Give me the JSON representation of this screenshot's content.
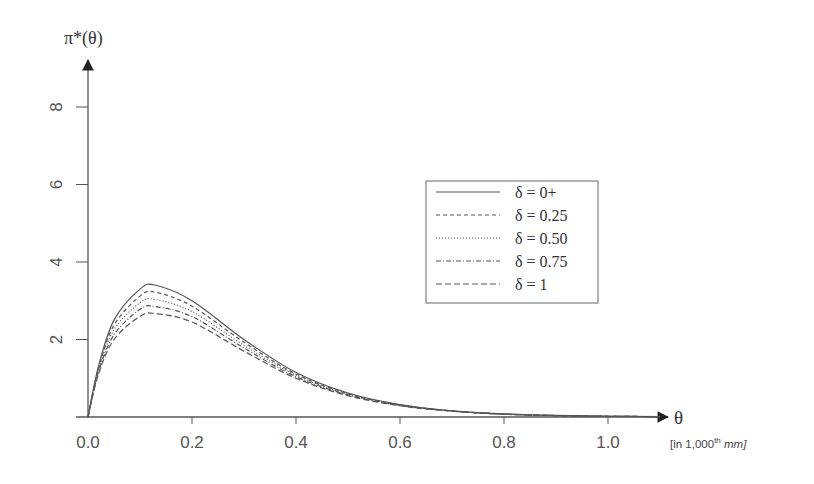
{
  "chart_data": {
    "type": "line",
    "title": "",
    "ylabel": "π*(θ)",
    "xlabel": "θ",
    "xlabel_unit_prefix": "[in 1,000",
    "xlabel_unit_sup": "th",
    "xlabel_unit_suffix": " mm]",
    "xlim": [
      0,
      1.1
    ],
    "ylim": [
      0,
      9
    ],
    "x_ticks": [
      0.0,
      0.2,
      0.4,
      0.6,
      0.8,
      1.0
    ],
    "x_tick_labels": [
      "0.0",
      "0.2",
      "0.4",
      "0.6",
      "0.8",
      "1.0"
    ],
    "y_ticks": [
      2,
      4,
      6,
      8
    ],
    "y_tick_labels": [
      "2",
      "4",
      "6",
      "8"
    ],
    "grid": false,
    "legend_position": "center-right",
    "x": [
      0,
      0.02,
      0.05,
      0.1,
      0.13,
      0.2,
      0.3,
      0.4,
      0.5,
      0.6,
      0.7,
      0.8,
      0.9,
      1.0,
      1.1
    ],
    "series": [
      {
        "name": "δ = 0+",
        "style": "solid",
        "values": [
          0,
          1.3,
          2.5,
          3.3,
          3.4,
          3.0,
          2.0,
          1.15,
          0.62,
          0.32,
          0.16,
          0.08,
          0.04,
          0.02,
          0.01
        ]
      },
      {
        "name": "δ = 0.25",
        "style": "dashed",
        "values": [
          0,
          1.25,
          2.37,
          3.12,
          3.22,
          2.86,
          1.93,
          1.11,
          0.6,
          0.31,
          0.16,
          0.078,
          0.039,
          0.02,
          0.01
        ]
      },
      {
        "name": "δ = 0.50",
        "style": "dotted",
        "values": [
          0,
          1.2,
          2.25,
          2.95,
          3.03,
          2.72,
          1.85,
          1.08,
          0.59,
          0.31,
          0.155,
          0.076,
          0.038,
          0.019,
          0.01
        ]
      },
      {
        "name": "δ = 0.75",
        "style": "dashdot",
        "values": [
          0,
          1.15,
          2.12,
          2.78,
          2.85,
          2.59,
          1.78,
          1.04,
          0.57,
          0.3,
          0.152,
          0.073,
          0.036,
          0.019,
          0.01
        ]
      },
      {
        "name": "δ = 1",
        "style": "longdash",
        "values": [
          0,
          1.1,
          2.0,
          2.6,
          2.67,
          2.45,
          1.7,
          1.0,
          0.55,
          0.29,
          0.15,
          0.07,
          0.035,
          0.018,
          0.01
        ]
      }
    ]
  },
  "colors": {
    "line": "#555555",
    "axis": "#444444",
    "text": "#444444"
  }
}
